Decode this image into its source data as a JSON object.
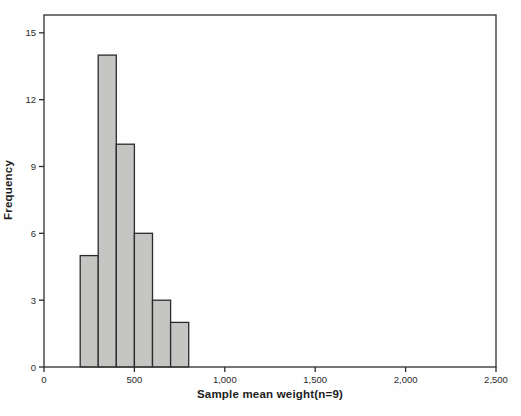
{
  "chart_data": {
    "type": "bar",
    "subtype": "histogram",
    "title": "",
    "xlabel": "Sample mean weight(n=9)",
    "ylabel": "Frequency",
    "bins": [
      {
        "x0": 200,
        "x1": 300,
        "freq": 5
      },
      {
        "x0": 300,
        "x1": 400,
        "freq": 14
      },
      {
        "x0": 400,
        "x1": 500,
        "freq": 10
      },
      {
        "x0": 500,
        "x1": 600,
        "freq": 6
      },
      {
        "x0": 600,
        "x1": 700,
        "freq": 3
      },
      {
        "x0": 700,
        "x1": 800,
        "freq": 2
      }
    ],
    "xlim": [
      0,
      2500
    ],
    "ylim": [
      0,
      15.8
    ],
    "x_ticks": [
      0,
      500,
      1000,
      1500,
      2000,
      2500
    ],
    "x_tick_labels": [
      "0",
      "500",
      "1,000",
      "1,500",
      "2,000",
      "2,500"
    ],
    "y_ticks": [
      0,
      3,
      6,
      9,
      12,
      15
    ],
    "y_tick_labels": [
      "0",
      "3",
      "6",
      "9",
      "12",
      "15"
    ],
    "grid": false,
    "legend": "none",
    "colors": {
      "bar_fill": "#c5c6c4",
      "bar_stroke": "#2b2b2b",
      "frame": "#3d3d3d",
      "tick": "#2b2b2b",
      "tick_text": "#2a2a2a",
      "background": "#fefefe"
    }
  }
}
